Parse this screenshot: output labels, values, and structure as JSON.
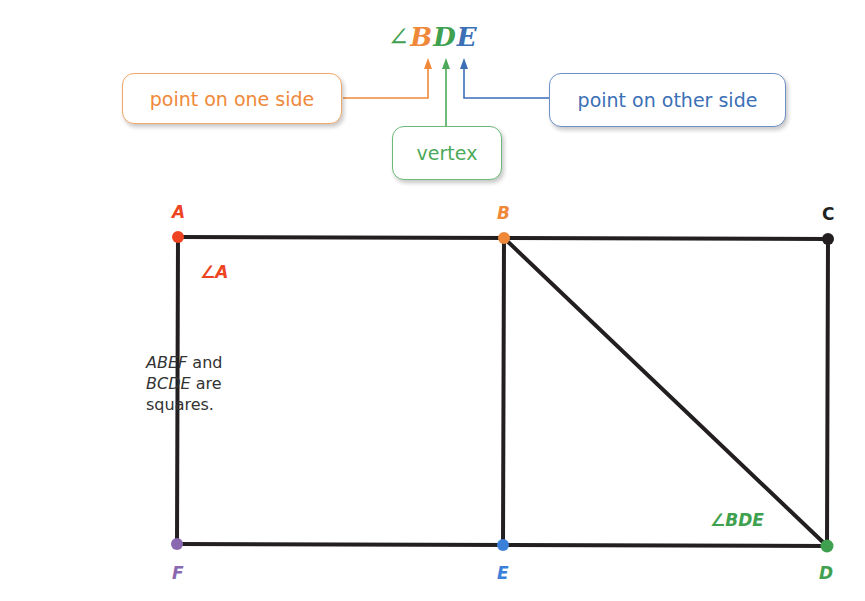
{
  "notation": {
    "angle_symbol": "∠",
    "letters": [
      {
        "char": "B",
        "color": "#f0883a"
      },
      {
        "char": "D",
        "color": "#3fa14f"
      },
      {
        "char": "E",
        "color": "#3b6fb6"
      }
    ]
  },
  "callouts": {
    "one_side": {
      "label": "point on one side",
      "color": "#f0883a"
    },
    "vertex": {
      "label": "vertex",
      "color": "#4caa5a"
    },
    "other_side": {
      "label": "point on other side",
      "color": "#3b6fb6"
    }
  },
  "figure": {
    "points": {
      "A": {
        "label": "A",
        "color": "#ee4422",
        "x": 178,
        "y": 237
      },
      "B": {
        "label": "B",
        "color": "#f0883a",
        "x": 504,
        "y": 238
      },
      "C": {
        "label": "C",
        "color": "#222222",
        "x": 828,
        "y": 239
      },
      "D": {
        "label": "D",
        "color": "#3fa14f",
        "x": 827,
        "y": 546
      },
      "E": {
        "label": "E",
        "color": "#3b80d8",
        "x": 503,
        "y": 545
      },
      "F": {
        "label": "F",
        "color": "#8a68b0",
        "x": 177,
        "y": 544
      }
    },
    "angle_labels": {
      "angle_A": {
        "text": "∠A",
        "color": "#ee4422"
      },
      "angle_BDE": {
        "text": "∠BDE",
        "color": "#3fa14f"
      }
    },
    "line_color": "#231f20"
  },
  "note": {
    "line1_italic": "ABEF",
    "line1_rest": " and",
    "line2_italic": "BCDE",
    "line2_rest": " are",
    "line3": "squares."
  }
}
